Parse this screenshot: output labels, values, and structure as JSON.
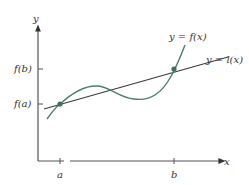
{
  "figure": {
    "type": "mean-value-theorem-diagram",
    "axes": {
      "x_label": "x",
      "y_label": "y"
    },
    "x_ticks": [
      {
        "label": "a",
        "px": 60
      },
      {
        "label": "b",
        "px": 174
      }
    ],
    "y_ticks": [
      {
        "label": "f(b)",
        "py": 69
      },
      {
        "label": "f(a)",
        "py": 104
      }
    ],
    "curves": [
      {
        "name": "f",
        "label": "y = f(x)",
        "color": "#4a7d70"
      },
      {
        "name": "l",
        "label": "y = l(x)",
        "color": "#3a3a3a"
      }
    ],
    "points": [
      {
        "name": "A",
        "at": "(a, f(a))"
      },
      {
        "name": "B",
        "at": "(b, f(b))"
      }
    ],
    "colors": {
      "axis": "#555555",
      "curve": "#4a7d70",
      "line": "#3a3a3a",
      "point": "#3f6f62",
      "text": "#333333"
    }
  }
}
